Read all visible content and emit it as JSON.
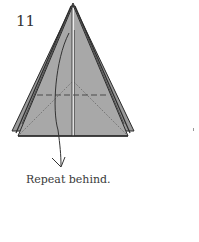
{
  "step": {
    "number": "11"
  },
  "caption": {
    "text": "Repeat behind."
  },
  "diagram": {
    "fill_color": "#a6a6a6",
    "outline_color": "#2b2b2b",
    "line_types": [
      "valley-fold-dashed",
      "crease-dotted",
      "arrow-curved"
    ],
    "colors": {
      "paper": "#a6a6a6",
      "paper_edge": "#8f8f8f",
      "outline": "#2b2b2b",
      "center_gap": "#ffffff",
      "dashed_line": "#4a4a4a",
      "dotted_line": "#555555",
      "arrow": "#333333"
    }
  }
}
